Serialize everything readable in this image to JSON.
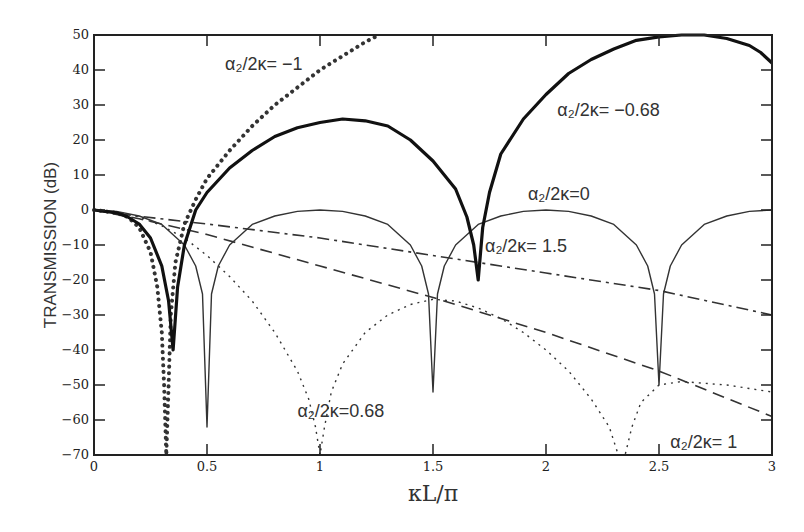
{
  "chart_data": {
    "type": "line",
    "title": "",
    "xlabel": "κL/π",
    "ylabel": "TRANSMISSION (dB)",
    "xlim": [
      0,
      3
    ],
    "ylim": [
      -70,
      50
    ],
    "xticks": [
      0,
      0.5,
      1,
      1.5,
      2,
      2.5,
      3
    ],
    "xtick_labels": [
      "0",
      "0.5",
      "1",
      "1.5",
      "2",
      "2.5",
      "3"
    ],
    "yticks": [
      50,
      40,
      30,
      20,
      10,
      0,
      -10,
      -20,
      -30,
      -40,
      -50,
      -60,
      -70
    ],
    "ytick_labels": [
      "50",
      "40",
      "30",
      "20",
      "10",
      "0",
      "-10",
      "-20",
      "-30",
      "-40",
      "-50",
      "-60",
      "-70"
    ],
    "grid": false,
    "legend": "none (inline annotations)",
    "series": [
      {
        "name": "α2/2κ = 0",
        "style": "thin-solid",
        "x": [
          0,
          0.1,
          0.2,
          0.3,
          0.4,
          0.45,
          0.48,
          0.5,
          0.52,
          0.55,
          0.6,
          0.7,
          0.8,
          0.9,
          1.0,
          1.1,
          1.2,
          1.3,
          1.4,
          1.45,
          1.48,
          1.5,
          1.52,
          1.55,
          1.6,
          1.7,
          1.8,
          1.9,
          2.0,
          2.1,
          2.2,
          2.3,
          2.4,
          2.45,
          2.48,
          2.5,
          2.52,
          2.55,
          2.6,
          2.7,
          2.8,
          2.9,
          3.0
        ],
        "y": [
          0,
          -0.4,
          -1.7,
          -4.1,
          -10,
          -16,
          -24,
          -62,
          -24,
          -16,
          -10,
          -4.1,
          -1.7,
          -0.4,
          0,
          -0.4,
          -1.7,
          -4.1,
          -10,
          -16,
          -24,
          -52,
          -24,
          -16,
          -10,
          -4.1,
          -1.7,
          -0.4,
          0,
          -0.4,
          -1.7,
          -4.1,
          -10,
          -16,
          -24,
          -50,
          -24,
          -16,
          -10,
          -4.1,
          -1.7,
          -0.4,
          0
        ]
      },
      {
        "name": "α2/2κ = 0.68",
        "style": "fine-dotted",
        "x": [
          0,
          0.1,
          0.2,
          0.3,
          0.4,
          0.5,
          0.6,
          0.7,
          0.8,
          0.9,
          0.95,
          0.98,
          1.0,
          1.02,
          1.05,
          1.1,
          1.2,
          1.3,
          1.4,
          1.5,
          1.6,
          1.7,
          1.8,
          1.9,
          2.0,
          2.1,
          2.2,
          2.28,
          2.32,
          2.35,
          2.38,
          2.42,
          2.5,
          2.6,
          2.7,
          2.8,
          2.9,
          3.0
        ],
        "y": [
          0,
          -0.5,
          -2,
          -4.5,
          -8,
          -13,
          -19,
          -26,
          -35,
          -46,
          -54,
          -62,
          -70,
          -62,
          -52,
          -44,
          -35,
          -30,
          -27,
          -25.5,
          -26,
          -28,
          -31,
          -35,
          -40,
          -46,
          -54,
          -62,
          -70,
          -70,
          -62,
          -55,
          -50,
          -49,
          -49.5,
          -50,
          -51,
          -52
        ]
      },
      {
        "name": "α2/2κ = 1",
        "style": "dashed",
        "x": [
          0,
          0.2,
          0.5,
          1.0,
          1.5,
          2.0,
          2.5,
          3.0
        ],
        "y": [
          0,
          -2.5,
          -7,
          -16,
          -25,
          -35,
          -46,
          -59
        ]
      },
      {
        "name": "α2/2κ = 1.5",
        "style": "dash-dot",
        "x": [
          0,
          0.2,
          0.5,
          1.0,
          1.5,
          2.0,
          2.5,
          3.0
        ],
        "y": [
          0,
          -1.8,
          -4,
          -8,
          -13,
          -18,
          -23,
          -30
        ]
      },
      {
        "name": "α2/2κ = -1",
        "style": "heavy-dotted",
        "x": [
          0,
          0.1,
          0.15,
          0.2,
          0.25,
          0.28,
          0.3,
          0.31,
          0.32,
          0.33,
          0.34,
          0.36,
          0.4,
          0.45,
          0.5,
          0.6,
          0.7,
          0.8,
          0.9,
          1.0,
          1.1,
          1.2,
          1.26
        ],
        "y": [
          0,
          -0.8,
          -2,
          -5,
          -12,
          -22,
          -35,
          -50,
          -70,
          -50,
          -30,
          -15,
          -4,
          3,
          9,
          17,
          24,
          30,
          35,
          40,
          44,
          48,
          50
        ]
      },
      {
        "name": "α2/2κ = -0.68",
        "style": "thick-solid",
        "x": [
          0,
          0.1,
          0.15,
          0.2,
          0.25,
          0.3,
          0.33,
          0.35,
          0.37,
          0.4,
          0.45,
          0.5,
          0.6,
          0.7,
          0.8,
          0.9,
          1.0,
          1.1,
          1.2,
          1.3,
          1.4,
          1.5,
          1.6,
          1.65,
          1.68,
          1.7,
          1.72,
          1.75,
          1.8,
          1.9,
          2.0,
          2.1,
          2.2,
          2.3,
          2.4,
          2.5,
          2.6,
          2.7,
          2.8,
          2.9,
          2.95,
          3.0
        ],
        "y": [
          0,
          -0.8,
          -2,
          -4,
          -8,
          -16,
          -26,
          -40,
          -22,
          -10,
          0,
          5,
          12,
          17,
          21,
          23.5,
          25,
          26,
          25.5,
          24,
          20,
          14,
          6,
          -2,
          -10,
          -20,
          -5,
          5,
          16,
          26,
          33,
          39,
          43,
          46,
          48.5,
          49.5,
          50,
          50,
          49,
          47,
          45,
          42
        ]
      }
    ],
    "annotations": [
      {
        "text": "α₂/2κ= −1",
        "x": 0.58,
        "y": 40
      },
      {
        "text": "α₂/2κ= −0.68",
        "x": 2.05,
        "y": 27
      },
      {
        "text": "α₂/2κ=0",
        "x": 1.92,
        "y": 3
      },
      {
        "text": "α₂/2κ= 1.5",
        "x": 1.73,
        "y": -12
      },
      {
        "text": "α₂/2κ=0.68",
        "x": 0.9,
        "y": -59
      },
      {
        "text": "α₂/2κ= 1",
        "x": 2.55,
        "y": -68
      }
    ]
  }
}
